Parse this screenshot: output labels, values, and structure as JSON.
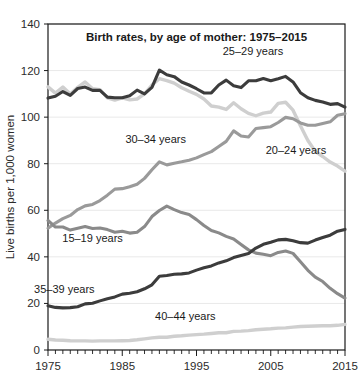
{
  "chart_data": {
    "type": "line",
    "title": "Birth rates, by age of mother: 1975–2015",
    "xlabel": "",
    "ylabel": "Live births per 1,000 women",
    "xlim": [
      1975,
      2015
    ],
    "ylim": [
      0,
      140
    ],
    "ytick_step": 20,
    "yticks": [
      0,
      20,
      40,
      60,
      80,
      100,
      120,
      140
    ],
    "xticks": [
      1975,
      1985,
      1995,
      2005,
      2015
    ],
    "xticks_minor_step": 1,
    "grid": true,
    "legend_position": "inline-annotations",
    "x": [
      1975,
      1976,
      1977,
      1978,
      1979,
      1980,
      1981,
      1982,
      1983,
      1984,
      1985,
      1986,
      1987,
      1988,
      1989,
      1990,
      1991,
      1992,
      1993,
      1994,
      1995,
      1996,
      1997,
      1998,
      1999,
      2000,
      2001,
      2002,
      2003,
      2004,
      2005,
      2006,
      2007,
      2008,
      2009,
      2010,
      2011,
      2012,
      2013,
      2014,
      2015
    ],
    "series": [
      {
        "name": "25–29 years",
        "color": "#3c3c3c",
        "width": 3.1,
        "label": "25–29 years",
        "label_x": 2002.6,
        "label_y": 126.5,
        "values": [
          108.2,
          109.0,
          111.0,
          109.3,
          112.3,
          112.9,
          111.5,
          111.5,
          108.6,
          108.3,
          108.3,
          109.2,
          111.6,
          110.0,
          112.8,
          120.2,
          118.2,
          117.4,
          115.1,
          113.8,
          112.2,
          110.4,
          110.4,
          113.8,
          115.9,
          113.5,
          112.7,
          115.6,
          115.6,
          116.6,
          115.6,
          116.5,
          117.5,
          115.1,
          110.5,
          108.3,
          107.2,
          106.5,
          105.5,
          105.8,
          104.3
        ]
      },
      {
        "name": "20–24 years",
        "color": "#cfcfcf",
        "width": 3.4,
        "label": "20–24 years",
        "label_x": 2008.4,
        "label_y": 84.0,
        "values": [
          113.0,
          110.3,
          112.9,
          109.9,
          112.8,
          115.1,
          112.2,
          111.8,
          108.3,
          107.3,
          108.3,
          107.4,
          107.8,
          110.0,
          113.8,
          116.5,
          115.7,
          114.6,
          112.6,
          111.1,
          109.8,
          107.8,
          104.8,
          104.3,
          103.3,
          106.2,
          103.6,
          101.6,
          100.6,
          101.7,
          102.2,
          105.9,
          106.4,
          103.0,
          96.3,
          90.0,
          85.3,
          83.1,
          80.7,
          79.0,
          76.8
        ]
      },
      {
        "name": "30–34 years",
        "color": "#9a9a9a",
        "width": 3.1,
        "label": "30–34 years",
        "label_x": 1989.5,
        "label_y": 89.0,
        "values": [
          52.3,
          54.5,
          56.4,
          57.8,
          60.3,
          61.9,
          62.5,
          64.2,
          66.5,
          69.1,
          69.3,
          70.1,
          71.2,
          73.7,
          77.4,
          80.8,
          79.5,
          80.2,
          80.8,
          81.5,
          82.5,
          83.9,
          85.2,
          87.4,
          89.6,
          94.1,
          91.9,
          91.5,
          95.1,
          95.5,
          95.9,
          97.7,
          99.9,
          99.3,
          97.5,
          96.5,
          96.5,
          97.3,
          98.0,
          100.8,
          101.5
        ]
      },
      {
        "name": "15–19 years",
        "color": "#8a8a8a",
        "width": 3.1,
        "label": "15–19 years",
        "label_x": 1981.0,
        "label_y": 46.5,
        "values": [
          55.6,
          52.8,
          52.8,
          51.5,
          52.3,
          53.0,
          52.2,
          52.4,
          51.7,
          50.6,
          51.0,
          50.2,
          50.6,
          53.0,
          57.3,
          59.9,
          61.8,
          60.3,
          59.0,
          58.2,
          56.0,
          53.5,
          51.3,
          50.3,
          48.8,
          47.7,
          45.3,
          43.0,
          41.6,
          41.1,
          40.5,
          41.9,
          42.5,
          41.5,
          37.9,
          34.2,
          31.3,
          29.4,
          26.5,
          24.2,
          22.3
        ]
      },
      {
        "name": "35–39 years",
        "color": "#3c3c3c",
        "width": 3.1,
        "label": "35–39 years",
        "label_x": 1977.2,
        "label_y": 24.5,
        "values": [
          19.0,
          18.3,
          18.1,
          18.2,
          18.6,
          19.8,
          20.1,
          21.1,
          22.0,
          22.8,
          24.0,
          24.4,
          25.0,
          26.3,
          28.0,
          31.7,
          32.0,
          32.5,
          32.7,
          33.1,
          34.3,
          35.3,
          36.1,
          37.4,
          38.3,
          39.7,
          40.6,
          41.4,
          43.8,
          45.4,
          46.3,
          47.3,
          47.5,
          46.9,
          46.1,
          45.9,
          47.2,
          48.3,
          49.3,
          51.0,
          51.8
        ]
      },
      {
        "name": "40–44 years",
        "color": "#cfcfcf",
        "width": 3.4,
        "label": "40–44 years",
        "label_x": 1993.5,
        "label_y": 13.0,
        "values": [
          4.6,
          4.3,
          4.2,
          4.0,
          3.9,
          3.9,
          3.8,
          3.9,
          3.9,
          3.9,
          4.0,
          4.1,
          4.4,
          4.8,
          5.2,
          5.5,
          5.5,
          5.9,
          6.1,
          6.4,
          6.6,
          6.8,
          7.1,
          7.4,
          7.4,
          8.0,
          8.1,
          8.3,
          8.7,
          8.9,
          9.1,
          9.4,
          9.5,
          9.8,
          10.1,
          10.2,
          10.3,
          10.4,
          10.4,
          10.6,
          11.0
        ]
      }
    ]
  }
}
